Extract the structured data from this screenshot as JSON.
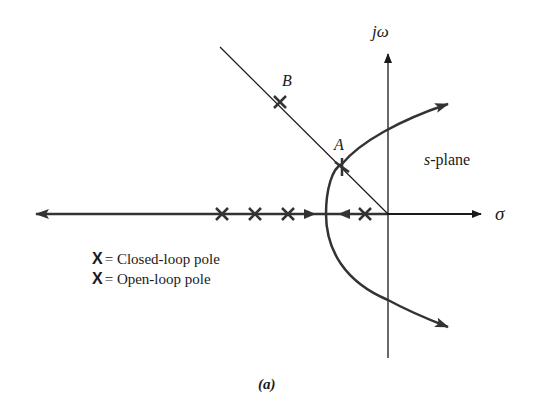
{
  "figure": {
    "caption": "(a)",
    "plane_label_prefix": "s",
    "plane_label_suffix": "-plane",
    "axes": {
      "imag_label": "jω",
      "real_label": "σ"
    },
    "points": [
      {
        "id": "A",
        "label": "A"
      },
      {
        "id": "B",
        "label": "B"
      }
    ],
    "legend": [
      {
        "symbol": "X",
        "text": "= Closed-loop pole"
      },
      {
        "symbol": "X",
        "text": "= Open-loop pole"
      }
    ],
    "open_loop_poles_count": 4,
    "colors": {
      "line": "#1a1a1a",
      "background": "#ffffff"
    }
  }
}
